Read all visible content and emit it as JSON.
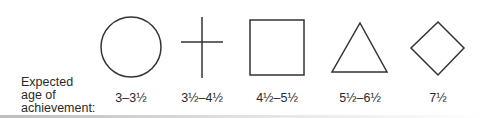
{
  "row_label": {
    "line1": "Expected",
    "line2": "age of",
    "line3": "achievement:"
  },
  "shapes": [
    {
      "name": "circle",
      "age": "3–3½"
    },
    {
      "name": "cross",
      "age": "3½–4½"
    },
    {
      "name": "square",
      "age": "4½–5½"
    },
    {
      "name": "triangle",
      "age": "5½–6½"
    },
    {
      "name": "diamond",
      "age": "7½"
    }
  ],
  "colors": {
    "stroke": "#333333",
    "text": "#2a2a2a"
  }
}
